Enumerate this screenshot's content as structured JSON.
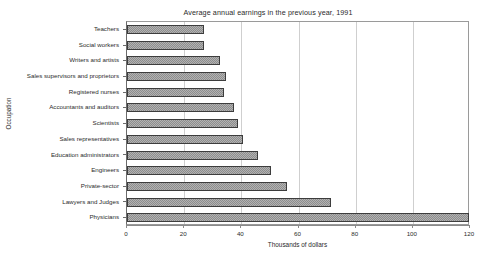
{
  "chart_data": {
    "type": "bar",
    "orientation": "horizontal",
    "title": "Average annual earnings in the previous year, 1991",
    "xlabel": "Thousands of dollars",
    "ylabel": "Occupation",
    "xlim": [
      0,
      120
    ],
    "xticks": [
      0,
      20,
      40,
      60,
      80,
      100,
      120
    ],
    "xticklabels": [
      "0",
      "20",
      "40",
      "60",
      "80",
      "100",
      "120"
    ],
    "grid": "vertical",
    "legend": "none",
    "units": "thousands of dollars",
    "categories": [
      "Teachers",
      "Social workers",
      "Writers and artists",
      "Sales supervisors and proprietors",
      "Registered nurses",
      "Accountants and auditors",
      "Scientists",
      "Sales representatives",
      "Education administrators",
      "Engineers",
      "Private-sector",
      "Lawyers and Judges",
      "Physicians"
    ],
    "values": [
      27,
      27,
      32.5,
      34.5,
      34,
      37.5,
      39,
      40.5,
      46,
      50.5,
      56,
      71.5,
      119.5
    ],
    "series": [
      {
        "name": "Average annual earnings",
        "values": [
          27,
          27,
          32.5,
          34.5,
          34,
          37.5,
          39,
          40.5,
          46,
          50.5,
          56,
          71.5,
          119.5
        ]
      }
    ],
    "bar_fill_color": "#b2b2b2",
    "bar_edge_color": "#3d3d3d",
    "grid_color": "#cfcfcf",
    "frame_color": "#9a9a9a",
    "background_color": "#ffffff"
  }
}
